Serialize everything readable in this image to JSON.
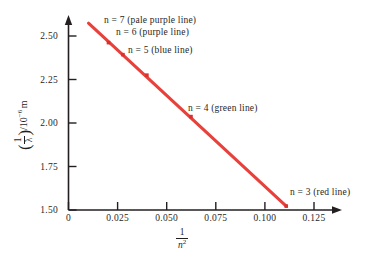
{
  "figure": {
    "background": "#ffffff",
    "line_color": "#e8413c",
    "axis_color": "#231f20",
    "text_color": "#1f1f1f"
  },
  "axes": {
    "x": {
      "title_numerator": "1",
      "title_denominator": "n",
      "title_denominator_exp": "2",
      "ticks": [
        "0",
        "0.025",
        "0.050",
        "0.075",
        "0.100",
        "0.125"
      ],
      "tick_values": [
        0,
        0.025,
        0.05,
        0.075,
        0.1,
        0.125
      ],
      "min": 0,
      "max": 0.136
    },
    "y": {
      "title_numerator": "1",
      "title_denominator": "λ",
      "title_scale": "/10",
      "title_exponent": "−6",
      "title_unit": "m",
      "ticks": [
        "1.50",
        "1.75",
        "2.00",
        "2.25",
        "2.50"
      ],
      "tick_values": [
        1.5,
        1.75,
        2.0,
        2.25,
        2.5
      ],
      "min": 1.5,
      "max": 2.62
    }
  },
  "annotations": [
    {
      "id": "n7",
      "text": "n  =  7 (pale purple line)"
    },
    {
      "id": "n6",
      "text": "n  =  6 (purple line)"
    },
    {
      "id": "n5",
      "text": "n  =  5 (blue line)"
    },
    {
      "id": "n4",
      "text": "n  =  4 (green line)"
    },
    {
      "id": "n3",
      "text": "n  =  3 (red line)"
    }
  ],
  "chart_data": {
    "type": "line",
    "title": "",
    "xlabel": "1/n^2",
    "ylabel": "(1/lambda)/10^-6 m",
    "xlim": [
      0,
      0.136
    ],
    "ylim": [
      1.5,
      2.62
    ],
    "grid": false,
    "legend_position": "inline-annotations",
    "line_color": "#e8413c",
    "series": [
      {
        "name": "Balmer series fit",
        "color": "#e8413c",
        "x": [
          0.0102,
          0.1111
        ],
        "y": [
          2.613,
          1.523
        ]
      }
    ],
    "points": [
      {
        "n": 7,
        "x": 0.020408,
        "y": 2.4971,
        "label": "n  =  7 (pale purple line)",
        "marker_color": "#e8413c"
      },
      {
        "n": 6,
        "x": 0.027778,
        "y": 2.4254,
        "label": "n  =  6 (purple line)",
        "marker_color": "#e8413c"
      },
      {
        "n": 5,
        "x": 0.04,
        "y": 2.3032,
        "label": "n  =  5 (blue line)",
        "marker_color": "#e8413c"
      },
      {
        "n": 4,
        "x": 0.0625,
        "y": 2.0564,
        "label": "n  =  4 (green line)",
        "marker_color": "#e8413c"
      },
      {
        "n": 3,
        "x": 0.111111,
        "y": 1.5233,
        "label": "n  =  3 (red line)",
        "marker_color": "#e8413c"
      }
    ]
  }
}
